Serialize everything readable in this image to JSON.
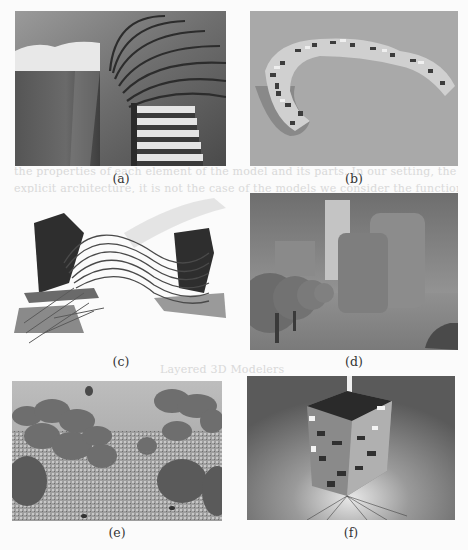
{
  "figure": {
    "panels": [
      {
        "id": "a",
        "caption": "(a)",
        "subject": "spiral-staircase-render"
      },
      {
        "id": "b",
        "caption": "(b)",
        "subject": "voxel-arc-sculpture-render"
      },
      {
        "id": "c",
        "caption": "(c)",
        "subject": "twisted-ribbon-structure-render"
      },
      {
        "id": "d",
        "caption": "(d)",
        "subject": "foggy-cityscape-spheres-render"
      },
      {
        "id": "e",
        "caption": "(e)",
        "subject": "mushroom-field-balloon-render"
      },
      {
        "id": "f",
        "caption": "(f)",
        "subject": "exploding-cube-tower-render"
      }
    ]
  },
  "bleed_through_text": {
    "line1": "the properties of each element of the model and its parts. In our setting, the tool are geometric for",
    "line2": "explicit architecture, it is not the case of the models we consider the functional",
    "line3": "ArtStudio and interaction using the graphical ... graphs and NSC",
    "heading": "Layered 3D Modelers",
    "line4": "The usage of FOG and XL is not realistic as the GeoNV Modeler. Its imple-"
  },
  "colors": {
    "page": "#fbfbfb",
    "caption_text": "#333333",
    "panel_b_bg": "#a9a9a9",
    "panel_d_sky": "#8c8c8c",
    "panel_f_bg": "#7a7a7a"
  }
}
